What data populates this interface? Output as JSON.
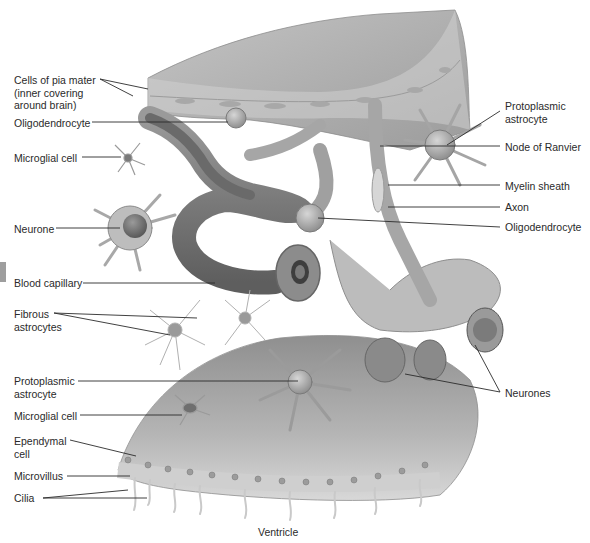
{
  "figure": {
    "bottom_caption": "Ventricle",
    "colors": {
      "tissue_light": "#d2d2d2",
      "tissue_mid": "#a9a9a9",
      "tissue_dark": "#6e6e6e",
      "leader_line": "#2b2b2b",
      "label_text": "#2a2a2a",
      "edge_tab": "#9e9e9e"
    }
  },
  "labels_left": [
    {
      "id": "pia-mater",
      "text": "Cells of pia mater\n(inner covering\naround brain)",
      "x": 14,
      "y": 74
    },
    {
      "id": "oligodendrocyte-top",
      "text": "Oligodendrocyte",
      "x": 14,
      "y": 118
    },
    {
      "id": "microglial-top",
      "text": "Microglial cell",
      "x": 14,
      "y": 152
    },
    {
      "id": "neurone-left",
      "text": "Neurone",
      "x": 14,
      "y": 223
    },
    {
      "id": "blood-capillary",
      "text": "Blood capillary",
      "x": 14,
      "y": 277
    },
    {
      "id": "fibrous-astrocytes",
      "text": "Fibrous\nastrocytes",
      "x": 14,
      "y": 308
    },
    {
      "id": "protoplasmic-bottom",
      "text": "Protoplasmic\nastrocyte",
      "x": 14,
      "y": 375
    },
    {
      "id": "microglial-bottom",
      "text": "Microglial cell",
      "x": 14,
      "y": 410
    },
    {
      "id": "ependymal",
      "text": "Ependymal\ncell",
      "x": 14,
      "y": 435
    },
    {
      "id": "microvillus",
      "text": "Microvillus",
      "x": 14,
      "y": 470
    },
    {
      "id": "cilia",
      "text": "Cilia",
      "x": 14,
      "y": 492
    }
  ],
  "labels_right": [
    {
      "id": "protoplasmic-top",
      "text": "Protoplasmic\nastrocyte",
      "x": 505,
      "y": 100
    },
    {
      "id": "node-ranvier",
      "text": "Node of Ranvier",
      "x": 505,
      "y": 141
    },
    {
      "id": "myelin-sheath",
      "text": "Myelin sheath",
      "x": 505,
      "y": 180
    },
    {
      "id": "axon",
      "text": "Axon",
      "x": 505,
      "y": 201
    },
    {
      "id": "oligodendrocyte-right",
      "text": "Oligodendrocyte",
      "x": 505,
      "y": 221
    },
    {
      "id": "neurones",
      "text": "Neurones",
      "x": 505,
      "y": 388
    }
  ],
  "caption": {
    "text": "Ventricle",
    "x": 258,
    "y": 527
  }
}
